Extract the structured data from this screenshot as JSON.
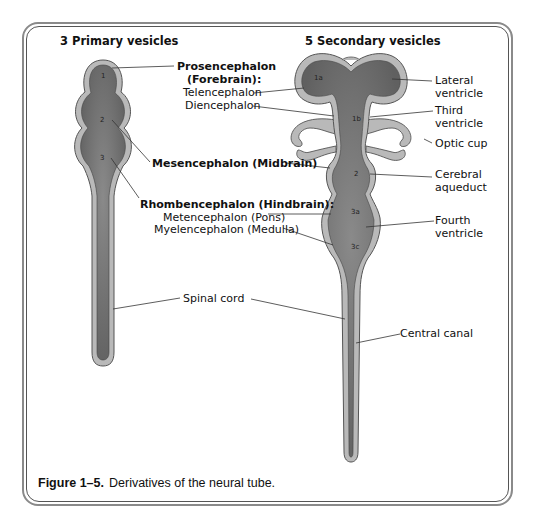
{
  "headings": {
    "primary": "3 Primary vesicles",
    "secondary": "5 Secondary vesicles"
  },
  "primary_vesicles": {
    "numbers": [
      "1",
      "2",
      "3"
    ],
    "labels": {
      "prosencephalon": "Prosencephalon",
      "forebrain": "(Forebrain):",
      "telencephalon": "Telencephalon",
      "diencephalon": "Diencephalon",
      "mesencephalon": "Mesencephalon (Midbrain)",
      "rhombencephalon": "Rhombencephalon (Hindbrain):",
      "metencephalon": "Metencephalon (Pons)",
      "myelencephalon": "Myelencephalon (Medulla)",
      "spinal_cord": "Spinal cord"
    }
  },
  "secondary_vesicles": {
    "numbers": [
      "1a",
      "1b",
      "2",
      "3a",
      "3c"
    ],
    "labels": {
      "lateral_ventricle_1": "Lateral",
      "lateral_ventricle_2": "ventricle",
      "third_ventricle_1": "Third",
      "third_ventricle_2": "ventricle",
      "optic_cup": "Optic cup",
      "cerebral_aqueduct_1": "Cerebral",
      "cerebral_aqueduct_2": "aqueduct",
      "fourth_ventricle_1": "Fourth",
      "fourth_ventricle_2": "ventricle",
      "central_canal": "Central canal"
    }
  },
  "caption": {
    "figure": "Figure 1–5.",
    "text": "Derivatives of the neural tube."
  },
  "colors": {
    "lumen": "#6e6e6e",
    "wall": "#b9b9b9",
    "outline": "#555555",
    "leader": "#333333"
  }
}
